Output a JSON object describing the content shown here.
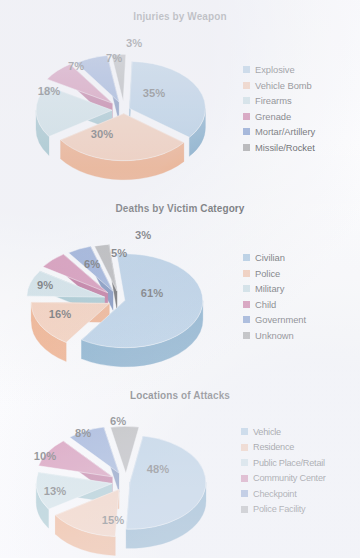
{
  "page": {
    "background": "#fdfdfe",
    "title_color": "#16181b"
  },
  "palette": {
    "explosive_blue": "#8fb7d9",
    "explosive_blue_side": "#3b7fae",
    "vehicle_orange": "#f3b692",
    "vehicle_orange_side": "#ec8244",
    "firearms_pale": "#b9d6dd",
    "firearms_pale_side": "#6fa8b4",
    "grenade_magenta": "#c1558a",
    "grenade_magenta_side": "#9c1f5e",
    "mortar_blue": "#5d80c2",
    "mortar_blue_side": "#2a4d93",
    "missile_grey": "#8e8e8e",
    "missile_grey_side": "#0d0d0d"
  },
  "chart_data": [
    {
      "type": "pie",
      "id": "injuries-by-weapon",
      "title": "Injuries by Weapon",
      "exploded": true,
      "three_d": true,
      "legend_position": "right",
      "labels": [
        "Explosive",
        "Vehicle Bomb",
        "Firearms",
        "Grenade",
        "Mortar/Artillery",
        "Missile/Rocket"
      ],
      "values": [
        35,
        30,
        18,
        7,
        7,
        3
      ],
      "value_labels": [
        "35%",
        "30%",
        "18%",
        "7%",
        "7%",
        "3%"
      ],
      "colors": [
        "#8fb7d9",
        "#f3b692",
        "#b9d6dd",
        "#c1558a",
        "#5d80c2",
        "#8e8e8e"
      ],
      "side_colors": [
        "#3b7fae",
        "#ec8244",
        "#6fa8b4",
        "#9c1f5e",
        "#2a4d93",
        "#0d0d0d"
      ]
    },
    {
      "type": "pie",
      "id": "deaths-by-victim-category",
      "title": "Deaths by Victim Category",
      "exploded": true,
      "three_d": true,
      "legend_position": "right",
      "labels": [
        "Civilian",
        "Police",
        "Military",
        "Child",
        "Government",
        "Unknown"
      ],
      "values": [
        61,
        16,
        9,
        6,
        5,
        3
      ],
      "value_labels": [
        "61%",
        "16%",
        "9%",
        "6%",
        "5%",
        "3%"
      ],
      "colors": [
        "#8fb7d9",
        "#f3b692",
        "#b9d6dd",
        "#c1558a",
        "#5d80c2",
        "#8e8e8e"
      ],
      "side_colors": [
        "#3b7fae",
        "#ec8244",
        "#6fa8b4",
        "#9c1f5e",
        "#2a4d93",
        "#0d0d0d"
      ]
    },
    {
      "type": "pie",
      "id": "locations-of-attacks",
      "title": "Locations of Attacks",
      "exploded": true,
      "three_d": true,
      "legend_position": "right",
      "labels": [
        "Vehicle",
        "Residence",
        "Public Place/Retail",
        "Community Center",
        "Checkpoint",
        "Police Facility"
      ],
      "values": [
        48,
        15,
        13,
        10,
        8,
        6
      ],
      "value_labels": [
        "48%",
        "15%",
        "13%",
        "10%",
        "8%",
        "6%"
      ],
      "colors": [
        "#8fb7d9",
        "#f3b692",
        "#b9d6dd",
        "#c1558a",
        "#5d80c2",
        "#8e8e8e"
      ],
      "side_colors": [
        "#3b7fae",
        "#ec8244",
        "#6fa8b4",
        "#9c1f5e",
        "#2a4d93",
        "#0d0d0d"
      ]
    }
  ]
}
